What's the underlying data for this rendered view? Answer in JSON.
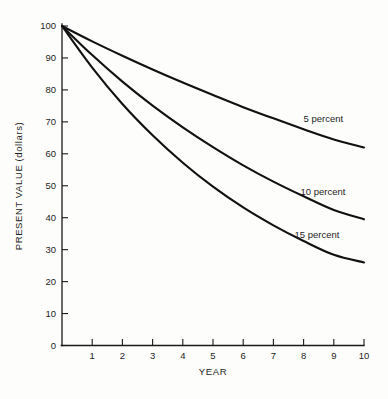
{
  "chart_data": {
    "type": "line",
    "title": "",
    "xlabel": "YEAR",
    "ylabel": "PRESENT VALUE (dollars)",
    "xlim": [
      0,
      10
    ],
    "ylim": [
      0,
      100
    ],
    "grid": false,
    "legend_position": "inline-right-of-curve",
    "x": [
      0,
      1,
      2,
      3,
      4,
      5,
      6,
      7,
      8,
      9,
      10
    ],
    "x_tick_labels": [
      "1",
      "2",
      "3",
      "4",
      "5",
      "6",
      "7",
      "8",
      "9",
      "10"
    ],
    "y_tick_labels": [
      "0",
      "10",
      "20",
      "30",
      "40",
      "50",
      "60",
      "70",
      "80",
      "90",
      "100"
    ],
    "y_ticks": [
      0,
      10,
      20,
      30,
      40,
      50,
      60,
      70,
      80,
      90,
      100
    ],
    "series": [
      {
        "name": "5 percent",
        "label": "5 percent",
        "color": "#111111",
        "values": [
          100,
          95.2,
          90.7,
          86.4,
          82.3,
          78.4,
          74.6,
          71.1,
          67.7,
          64.5,
          62.0
        ]
      },
      {
        "name": "10 percent",
        "label": "10 percent",
        "color": "#111111",
        "values": [
          100,
          90.9,
          82.6,
          75.1,
          68.3,
          62.1,
          56.4,
          51.3,
          46.7,
          42.4,
          39.5
        ]
      },
      {
        "name": "15 percent",
        "label": "15 percent",
        "color": "#111111",
        "values": [
          100,
          87.0,
          75.6,
          65.8,
          57.2,
          49.7,
          43.2,
          37.6,
          32.7,
          28.4,
          26.0
        ]
      }
    ],
    "annotations": [
      {
        "text": "5 percent",
        "x": 8.0,
        "y": 70.0
      },
      {
        "text": "10 percent",
        "x": 7.9,
        "y": 47.0
      },
      {
        "text": "15 percent",
        "x": 7.7,
        "y": 33.5
      }
    ]
  }
}
